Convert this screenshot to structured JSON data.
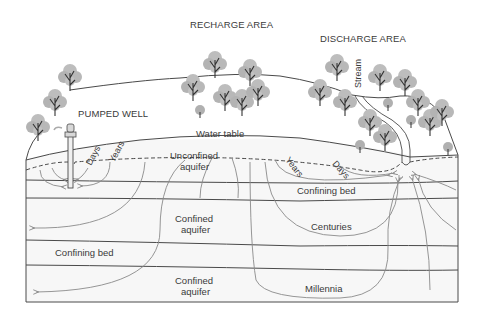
{
  "labels": {
    "recharge_area": "RECHARGE AREA",
    "discharge_area": "DISCHARGE AREA",
    "pumped_well": "PUMPED WELL",
    "stream": "Stream",
    "water_table": "Water table",
    "unconfined_aquifer_line1": "Unconfined",
    "unconfined_aquifer_line2": "aquifer",
    "confining_bed_upper": "Confining bed",
    "confined_aquifer_upper_line1": "Confined",
    "confined_aquifer_upper_line2": "aquifer",
    "confining_bed_lower": "Confining bed",
    "confined_aquifer_lower_line1": "Confined",
    "confined_aquifer_lower_line2": "aquifer",
    "centuries": "Centuries",
    "millennia": "Millennia",
    "days_well": "Days",
    "years_well": "Years",
    "years_stream": "Years",
    "days_stream": "Days"
  },
  "colors": {
    "line": "#4a4a4a",
    "flow_line": "#8a8a8a",
    "tree_foliage": "#b8b8b8",
    "tree_foliage_dark": "#a6a6a6",
    "trunk": "#333333",
    "ground_fill": "#f5f5f5"
  }
}
